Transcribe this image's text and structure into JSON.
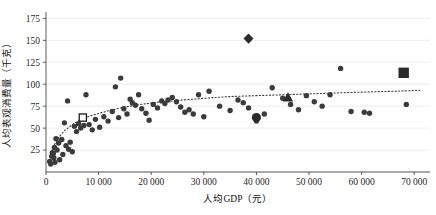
{
  "chart_data": {
    "type": "scatter",
    "title": "",
    "xlabel": "人均GDP（元）",
    "ylabel": "人均表观消费量（千克）",
    "xlim": [
      0,
      73000
    ],
    "ylim": [
      0,
      180
    ],
    "xticks": [
      0,
      10000,
      20000,
      30000,
      40000,
      50000,
      60000,
      70000
    ],
    "xtick_labels": [
      "0",
      "10 000",
      "20 000",
      "30 000",
      "40 000",
      "50 000",
      "60 000",
      "70 000"
    ],
    "yticks": [
      25,
      50,
      75,
      100,
      125,
      150,
      175
    ],
    "ytick_labels": [
      "25",
      "50",
      "75",
      "100",
      "125",
      "150",
      "175"
    ],
    "grid": true,
    "grid_axis": "y",
    "legend": "none",
    "marker_color": "#3b3b3b",
    "trendline": {
      "style": "dotted",
      "color": "#3a3a3a",
      "description": "logarithmic fit rising steeply below 10 000 then flattening near 90",
      "points": [
        [
          700,
          17
        ],
        [
          1500,
          30
        ],
        [
          2500,
          40
        ],
        [
          3500,
          47
        ],
        [
          5000,
          54
        ],
        [
          7000,
          61
        ],
        [
          9000,
          65
        ],
        [
          12000,
          70
        ],
        [
          15000,
          74
        ],
        [
          18000,
          77
        ],
        [
          22000,
          80
        ],
        [
          26000,
          82
        ],
        [
          30000,
          84
        ],
        [
          35000,
          86
        ],
        [
          40000,
          87
        ],
        [
          45000,
          88
        ],
        [
          50000,
          89
        ],
        [
          55000,
          90
        ],
        [
          60000,
          91
        ],
        [
          66000,
          92
        ],
        [
          71000,
          93
        ]
      ]
    },
    "series": [
      {
        "name": "省市观测点",
        "marker": "circle",
        "points": [
          [
            700,
            12
          ],
          [
            900,
            9
          ],
          [
            1100,
            18
          ],
          [
            1200,
            22
          ],
          [
            1400,
            21
          ],
          [
            1500,
            16
          ],
          [
            1600,
            28
          ],
          [
            1700,
            11
          ],
          [
            1900,
            38
          ],
          [
            2100,
            25
          ],
          [
            2400,
            33
          ],
          [
            2600,
            14
          ],
          [
            3000,
            37
          ],
          [
            3200,
            20
          ],
          [
            3500,
            56
          ],
          [
            3800,
            30
          ],
          [
            4100,
            81
          ],
          [
            4300,
            26
          ],
          [
            4600,
            34
          ],
          [
            5000,
            23
          ],
          [
            5400,
            52
          ],
          [
            5800,
            46
          ],
          [
            6200,
            55
          ],
          [
            6600,
            50
          ],
          [
            7200,
            53
          ],
          [
            7600,
            88
          ],
          [
            8200,
            54
          ],
          [
            8800,
            48
          ],
          [
            9400,
            60
          ],
          [
            10200,
            51
          ],
          [
            11000,
            63
          ],
          [
            11800,
            58
          ],
          [
            12600,
            69
          ],
          [
            13200,
            97
          ],
          [
            13800,
            62
          ],
          [
            14200,
            107
          ],
          [
            14800,
            72
          ],
          [
            15400,
            66
          ],
          [
            16000,
            83
          ],
          [
            16400,
            79
          ],
          [
            17000,
            76
          ],
          [
            17600,
            88
          ],
          [
            18200,
            72
          ],
          [
            19000,
            67
          ],
          [
            19600,
            59
          ],
          [
            20400,
            77
          ],
          [
            21200,
            73
          ],
          [
            22000,
            81
          ],
          [
            22600,
            78
          ],
          [
            23200,
            82
          ],
          [
            24000,
            85
          ],
          [
            24800,
            80
          ],
          [
            25600,
            74
          ],
          [
            26400,
            68
          ],
          [
            27200,
            71
          ],
          [
            28000,
            66
          ],
          [
            29000,
            88
          ],
          [
            30000,
            63
          ],
          [
            31000,
            92
          ],
          [
            33000,
            75
          ],
          [
            35000,
            70
          ],
          [
            36500,
            82
          ],
          [
            37500,
            79
          ],
          [
            38500,
            73
          ],
          [
            40000,
            58
          ],
          [
            41500,
            66
          ],
          [
            43000,
            96
          ],
          [
            45000,
            84
          ],
          [
            46500,
            77
          ],
          [
            48000,
            71
          ],
          [
            49500,
            87
          ],
          [
            51000,
            80
          ],
          [
            52500,
            75
          ],
          [
            54000,
            88
          ],
          [
            56000,
            118
          ],
          [
            58000,
            69
          ],
          [
            60500,
            68
          ],
          [
            61500,
            67
          ],
          [
            68500,
            77
          ]
        ]
      },
      {
        "name": "空心方块观测点",
        "marker": "open-square",
        "points": [
          [
            7000,
            62
          ]
        ]
      },
      {
        "name": "菱形观测点",
        "marker": "diamond",
        "points": [
          [
            38500,
            152
          ]
        ]
      },
      {
        "name": "实心方块观测点",
        "marker": "filled-square",
        "points": [
          [
            68000,
            113
          ]
        ]
      },
      {
        "name": "三角形观测点",
        "marker": "triangle",
        "points": [
          [
            46000,
            85
          ]
        ]
      },
      {
        "name": "大圆观测点",
        "marker": "large-circle",
        "points": [
          [
            40000,
            62
          ]
        ]
      }
    ]
  }
}
